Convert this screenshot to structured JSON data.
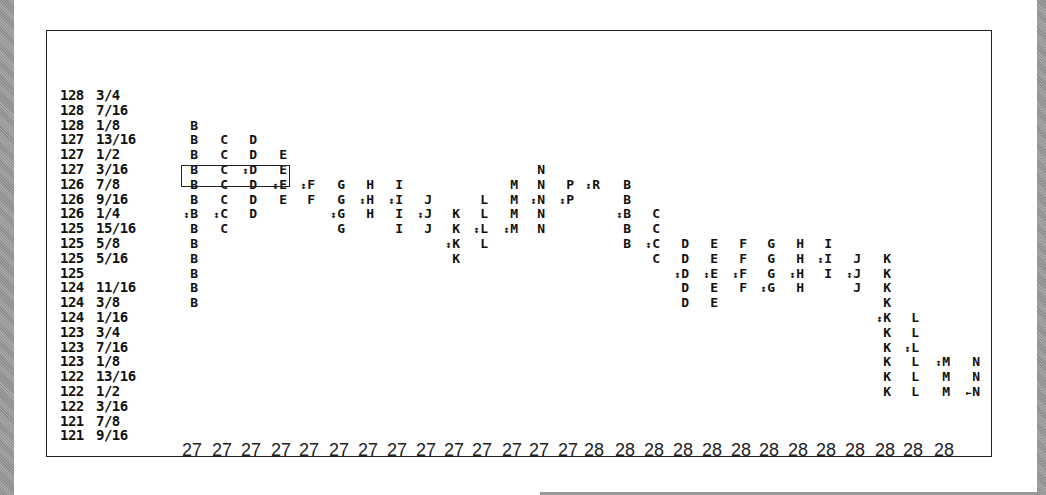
{
  "chart_data": {
    "type": "table",
    "title": "",
    "price_levels": [
      "128 3/4",
      "128 7/16",
      "128 1/8",
      "127 13/16",
      "127 1/2",
      "127 3/16",
      "126 7/8",
      "126 9/16",
      "126 1/4",
      "125 15/16",
      "125 5/8",
      "125 5/16",
      "125",
      "124 11/16",
      "124 3/8",
      "124 1/16",
      "123 3/4",
      "123 7/16",
      "123 1/8",
      "122 13/16",
      "122 1/2",
      "122 3/16",
      "121 7/8",
      "121 9/16"
    ],
    "x_labels": [
      "27",
      "27",
      "27",
      "27",
      "27",
      "27",
      "27",
      "27",
      "27",
      "27",
      "27",
      "27",
      "27",
      "27",
      "28",
      "28",
      "28",
      "28",
      "28",
      "28",
      "28",
      "28",
      "28",
      "28",
      "28",
      "28",
      "28"
    ],
    "value_area_box": {
      "from_row": 7,
      "to_row": 7,
      "columns": [
        "B",
        "C",
        "D",
        "E"
      ],
      "day": "27"
    },
    "columns": [
      {
        "day": "27",
        "letter": "B",
        "top_row": 2,
        "bottom_row": 14,
        "marker_row": 8,
        "x": 190
      },
      {
        "day": "27",
        "letter": "C",
        "top_row": 3,
        "bottom_row": 9,
        "marker_row": 8,
        "x": 220
      },
      {
        "day": "27",
        "letter": "D",
        "top_row": 3,
        "bottom_row": 8,
        "marker_row": 5,
        "x": 249
      },
      {
        "day": "27",
        "letter": "E",
        "top_row": 4,
        "bottom_row": 7,
        "marker_row": 6,
        "x": 279
      },
      {
        "day": "27",
        "letter": "F",
        "top_row": 6,
        "bottom_row": 7,
        "marker_row": 6,
        "x": 307
      },
      {
        "day": "27",
        "letter": "G",
        "top_row": 6,
        "bottom_row": 9,
        "marker_row": 8,
        "x": 337
      },
      {
        "day": "27",
        "letter": "H",
        "top_row": 6,
        "bottom_row": 8,
        "marker_row": 7,
        "x": 366
      },
      {
        "day": "27",
        "letter": "I",
        "top_row": 6,
        "bottom_row": 9,
        "marker_row": 7,
        "x": 395
      },
      {
        "day": "27",
        "letter": "J",
        "top_row": 7,
        "bottom_row": 9,
        "marker_row": 8,
        "x": 424
      },
      {
        "day": "27",
        "letter": "K",
        "top_row": 8,
        "bottom_row": 11,
        "marker_row": 10,
        "x": 452
      },
      {
        "day": "27",
        "letter": "L",
        "top_row": 7,
        "bottom_row": 10,
        "marker_row": 9,
        "x": 480
      },
      {
        "day": "27",
        "letter": "M",
        "top_row": 6,
        "bottom_row": 9,
        "marker_row": 9,
        "x": 510
      },
      {
        "day": "27",
        "letter": "N",
        "top_row": 5,
        "bottom_row": 9,
        "marker_row": 7,
        "x": 537
      },
      {
        "day": "27",
        "letter": "P",
        "top_row": 6,
        "bottom_row": 7,
        "marker_row": 7,
        "x": 566
      },
      {
        "day": "27",
        "letter": "R",
        "top_row": 6,
        "bottom_row": 6,
        "marker_row": 6,
        "x": 592
      },
      {
        "day": "28",
        "letter": "B",
        "top_row": 6,
        "bottom_row": 10,
        "marker_row": 8,
        "x": 623
      },
      {
        "day": "28",
        "letter": "C",
        "top_row": 8,
        "bottom_row": 11,
        "marker_row": 10,
        "x": 652
      },
      {
        "day": "28",
        "letter": "D",
        "top_row": 10,
        "bottom_row": 14,
        "marker_row": 12,
        "x": 681
      },
      {
        "day": "28",
        "letter": "E",
        "top_row": 10,
        "bottom_row": 14,
        "marker_row": 12,
        "x": 710
      },
      {
        "day": "28",
        "letter": "F",
        "top_row": 10,
        "bottom_row": 13,
        "marker_row": 12,
        "x": 739
      },
      {
        "day": "28",
        "letter": "G",
        "top_row": 10,
        "bottom_row": 13,
        "marker_row": 13,
        "x": 767
      },
      {
        "day": "28",
        "letter": "H",
        "top_row": 10,
        "bottom_row": 13,
        "marker_row": 12,
        "x": 796
      },
      {
        "day": "28",
        "letter": "I",
        "top_row": 10,
        "bottom_row": 12,
        "marker_row": 11,
        "x": 824
      },
      {
        "day": "28",
        "letter": "J",
        "top_row": 11,
        "bottom_row": 13,
        "marker_row": 12,
        "x": 853
      },
      {
        "day": "28",
        "letter": "K",
        "top_row": 11,
        "bottom_row": 20,
        "marker_row": 15,
        "x": 883
      },
      {
        "day": "28",
        "letter": "L",
        "top_row": 15,
        "bottom_row": 20,
        "marker_row": 17,
        "x": 911
      },
      {
        "day": "28",
        "letter": "M",
        "top_row": 18,
        "bottom_row": 20,
        "marker_row": 18,
        "x": 942
      },
      {
        "day": "28",
        "letter": "N",
        "top_row": 18,
        "bottom_row": 20,
        "marker_row": 20,
        "marker": "close",
        "x": 972
      }
    ],
    "markers": {
      "midpoint": "↕",
      "close": "←"
    }
  }
}
